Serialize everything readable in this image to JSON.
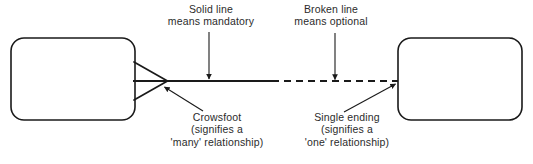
{
  "diagram": {
    "kind": "entity-relationship-notation-legend",
    "colors": {
      "stroke": "#1a1a1a",
      "text": "#2b2b2b",
      "background": "#ffffff",
      "entity_fill": "#ffffff"
    },
    "entities": [
      {
        "name": "left-entity",
        "label": "",
        "x": 11,
        "y": 38,
        "width": 124,
        "height": 82,
        "radius": 13
      },
      {
        "name": "right-entity",
        "label": "",
        "x": 398,
        "y": 38,
        "width": 124,
        "height": 82,
        "radius": 13
      }
    ],
    "relationship_line": {
      "solid_segment": {
        "x1": 133,
        "y1": 81,
        "x2": 272,
        "y2": 81
      },
      "dashed_segment": {
        "x1": 272,
        "y1": 81,
        "x2": 398,
        "y2": 81
      },
      "dash_pattern": "7 5"
    },
    "crowsfoot": {
      "apex_x": 167,
      "apex_y": 81,
      "base_x": 134,
      "upper_y": 62,
      "lower_y": 100
    },
    "annotations": [
      {
        "name": "solid-line-annotation",
        "lines": [
          "Solid line",
          "means mandatory"
        ],
        "arrow": {
          "x1": 209,
          "y1": 32,
          "x2": 209,
          "y2": 80,
          "style": "vertical-down"
        }
      },
      {
        "name": "broken-line-annotation",
        "lines": [
          "Broken line",
          "means optional"
        ],
        "arrow": {
          "x1": 335,
          "y1": 33,
          "x2": 335,
          "y2": 80,
          "style": "vertical-down"
        }
      },
      {
        "name": "crowsfoot-annotation",
        "lines": [
          "Crowsfoot",
          "(signifies a",
          "'many' relationship)"
        ],
        "arrow": {
          "x1": 203,
          "y1": 111,
          "x2": 164,
          "y2": 87,
          "style": "diagonal-up-left"
        }
      },
      {
        "name": "single-ending-annotation",
        "lines": [
          "Single ending",
          "(signifies a",
          "'one' relationship)"
        ],
        "arrow": {
          "x1": 344,
          "y1": 112,
          "x2": 395,
          "y2": 84,
          "style": "diagonal-up-right"
        }
      }
    ]
  },
  "labels": {
    "solid": {
      "line1": "Solid line",
      "line2": "means mandatory"
    },
    "broken": {
      "line1": "Broken line",
      "line2": "means optional"
    },
    "crowsfoot": {
      "line1": "Crowsfoot",
      "line2": "(signifies a",
      "line3": "'many' relationship)"
    },
    "single": {
      "line1": "Single ending",
      "line2": "(signifies a",
      "line3": "'one' relationship)"
    }
  }
}
